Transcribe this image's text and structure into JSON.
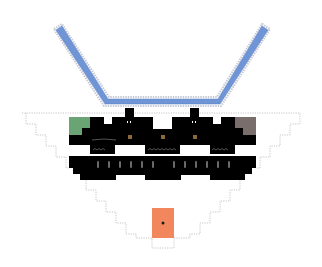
{
  "diagram": {
    "type": "pixel-schematic",
    "canvas": {
      "width": 322,
      "height": 267,
      "background": "#ffffff"
    },
    "colors": {
      "channel": "#6f95d6",
      "channel_outline": "#c8cbd6",
      "body": "#000000",
      "cutout": "#ffffff",
      "green_block": "#6aa374",
      "gray_block": "#7a6e6c",
      "orange_block": "#f2875e",
      "amber_dot": "#8a6a3a",
      "dotted_outline": "#b8b8b8",
      "slot": "#6a6a6a"
    },
    "elements": {
      "v_channel": {
        "label": ""
      },
      "stepped_outline": {
        "label": ""
      },
      "black_body": {
        "label": ""
      },
      "green_block": {
        "label": ""
      },
      "gray_block": {
        "label": ""
      },
      "orange_block": {
        "label": "",
        "center_dot": true
      },
      "amber_dots": {
        "count": 3
      },
      "slots": {
        "count": 12
      }
    }
  }
}
